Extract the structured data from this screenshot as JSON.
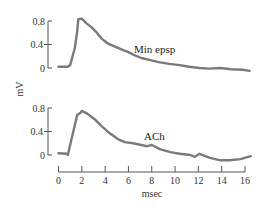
{
  "chart_data": [
    {
      "type": "line",
      "title": "",
      "series_label": "Min epsp",
      "ylabel": "mV",
      "xlabel": "msec",
      "yticks": [
        "0.8",
        "0.4",
        "0"
      ],
      "ylim": [
        0,
        0.8
      ],
      "xlim": [
        0,
        16
      ],
      "grid": false,
      "x": [
        0,
        0.8,
        1.0,
        1.4,
        1.6,
        1.7,
        2.0,
        2.4,
        2.8,
        3.2,
        3.7,
        4.2,
        4.9,
        5.5,
        6.0,
        6.5,
        7.1,
        7.8,
        8.6,
        9.5,
        10.4,
        11.2,
        12.1,
        12.9,
        13.9,
        14.8,
        15.8,
        16.4
      ],
      "values": [
        0.02,
        0.02,
        0.05,
        0.34,
        0.62,
        0.83,
        0.84,
        0.76,
        0.7,
        0.62,
        0.5,
        0.42,
        0.36,
        0.31,
        0.27,
        0.22,
        0.17,
        0.14,
        0.1,
        0.07,
        0.05,
        0.02,
        0.0,
        -0.01,
        0.0,
        -0.02,
        -0.03,
        -0.05
      ]
    },
    {
      "type": "line",
      "title": "",
      "series_label": "ACh",
      "ylabel": "mV",
      "xlabel": "msec",
      "yticks": [
        "0.8",
        "0.4",
        "0"
      ],
      "ylim": [
        0,
        0.8
      ],
      "xlim": [
        0,
        16
      ],
      "xticks": [
        "0",
        "2",
        "4",
        "6",
        "8",
        "10",
        "12",
        "14",
        "16"
      ],
      "grid": false,
      "x": [
        0,
        0.7,
        0.8,
        1.2,
        1.6,
        1.9,
        2.0,
        2.5,
        3.1,
        3.7,
        4.4,
        5.1,
        5.7,
        6.4,
        7.1,
        7.6,
        8.0,
        8.7,
        9.6,
        10.4,
        11.3,
        11.7,
        12.1,
        13.0,
        13.9,
        14.7,
        15.6,
        16.5
      ],
      "values": [
        0.03,
        0.02,
        0.0,
        0.34,
        0.68,
        0.72,
        0.75,
        0.7,
        0.61,
        0.49,
        0.37,
        0.27,
        0.22,
        0.2,
        0.17,
        0.15,
        0.17,
        0.1,
        0.05,
        0.02,
        0.0,
        -0.03,
        0.02,
        -0.05,
        -0.09,
        -0.09,
        -0.07,
        -0.02
      ]
    }
  ],
  "labels": {
    "top_series": "Min epsp",
    "bottom_series": "ACh",
    "ylabel": "mV",
    "xlabel": "msec",
    "yticks": [
      "0.8",
      "0.4",
      "0"
    ],
    "xticks": [
      "0",
      "2",
      "4",
      "6",
      "8",
      "10",
      "12",
      "14",
      "16"
    ]
  },
  "colors": {
    "trace": "#7a7a7a",
    "axis": "#555555",
    "text": "#333333"
  }
}
